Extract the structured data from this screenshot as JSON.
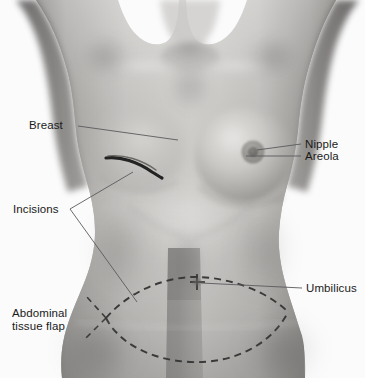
{
  "image": {
    "kind": "medical-illustration",
    "subject": "female torso front view",
    "background_color": "#ffffff",
    "width": 365,
    "height": 378
  },
  "labels": {
    "breast": "Breast",
    "incisions": "Incisions",
    "abdominal_tissue_flap": "Abdominal\ntissue flap",
    "nipple": "Nipple",
    "areola": "Areola",
    "umbilicus": "Umbilicus"
  },
  "markings": {
    "chest_incision": "curved dark incision line on left breast",
    "flap_outline": "dashed elliptical lens outline across lower abdomen",
    "midline_band": "vertical dark midline band on lower abdomen",
    "umbilicus_marker": "small cross marker at navel"
  },
  "colors": {
    "skin_light": "#d8d6d3",
    "skin_mid": "#b9b7b4",
    "skin_dark": "#8f8d8b",
    "skin_shadow": "#6f6d6c",
    "line_dark": "#2b2b2b",
    "leader_line": "#58585a",
    "text": "#1a1a1a",
    "background": "#ffffff"
  }
}
